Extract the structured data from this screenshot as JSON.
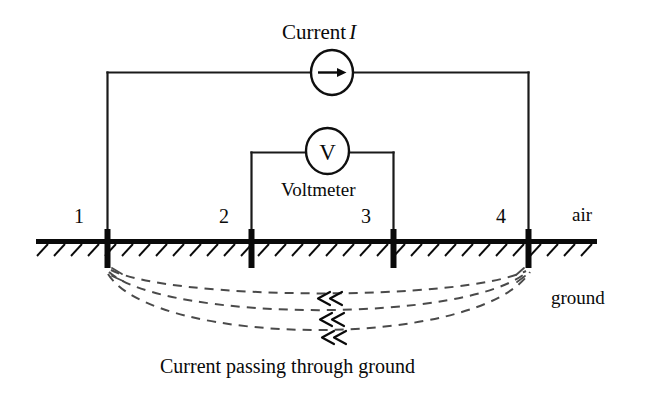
{
  "figure": {
    "title_label": "Current",
    "title_symbol": "I",
    "voltmeter_label": "Voltmeter",
    "voltmeter_symbol": "V",
    "ammeter_symbol": "arrow-right-icon",
    "air_label": "air",
    "ground_label": "ground",
    "caption": "Current passing through ground",
    "electrodes": [
      {
        "label": "1"
      },
      {
        "label": "2"
      },
      {
        "label": "3"
      },
      {
        "label": "4"
      }
    ],
    "colors": {
      "ink": "#0a0a0a",
      "wire": "#1a1a1a",
      "dashed_flow": "#4a4a4a",
      "background": "#ffffff"
    }
  }
}
